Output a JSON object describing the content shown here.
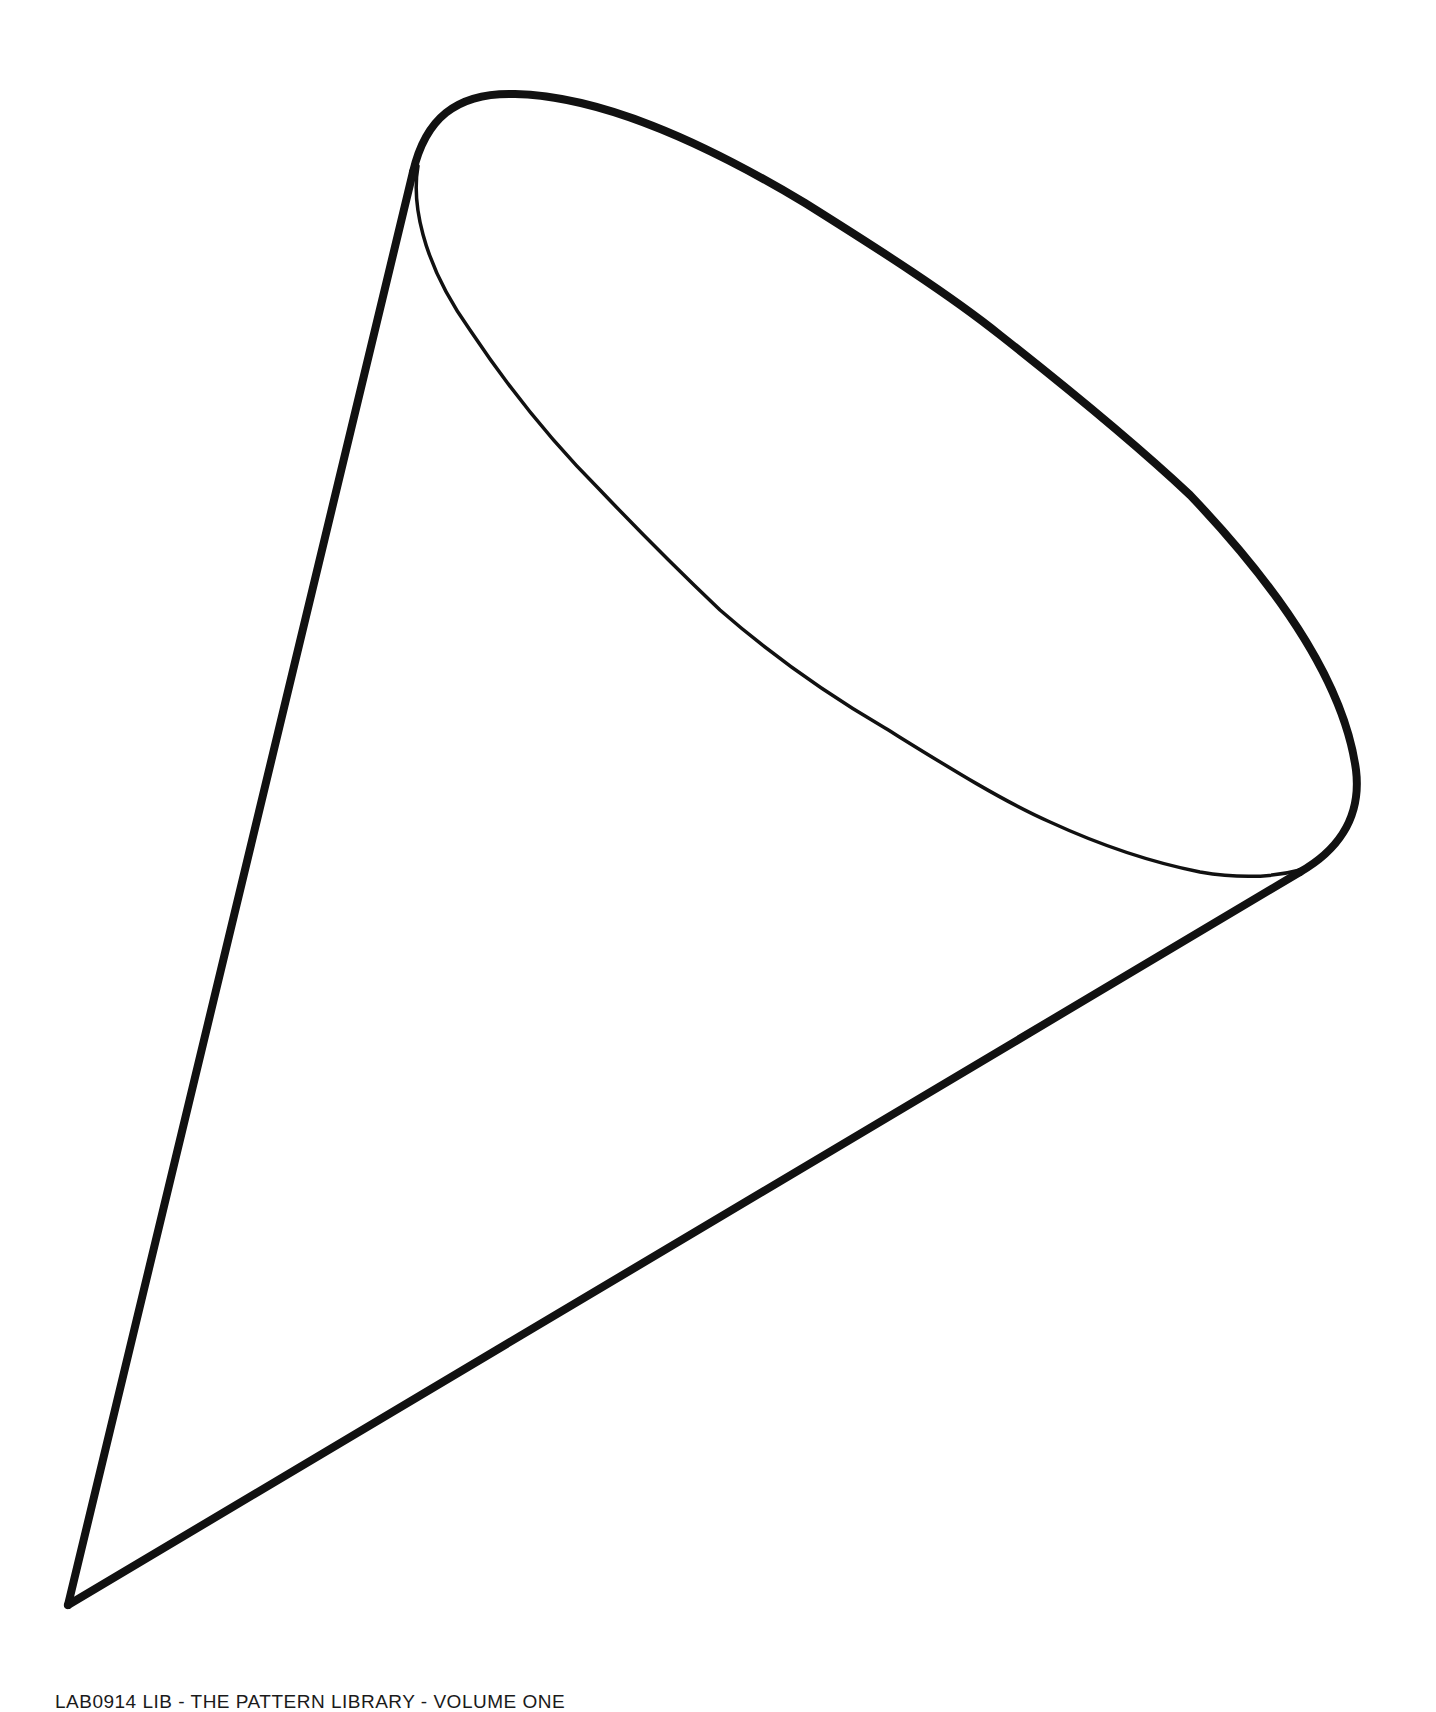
{
  "figure": {
    "stroke_color": "#111111",
    "background_color": "#ffffff",
    "outline_stroke_width": 8,
    "inner_rim_stroke_width": 3.5,
    "points": {
      "apex": [
        68,
        1605
      ],
      "rim_top": [
        515,
        94
      ],
      "rim_left_junction": [
        413,
        172
      ],
      "rim_right_extreme": [
        1355,
        790
      ],
      "rim_bottom_junction": [
        1300,
        872
      ]
    }
  },
  "footer": {
    "caption": "LAB0914 LIB - THE PATTERN LIBRARY - VOLUME ONE"
  }
}
